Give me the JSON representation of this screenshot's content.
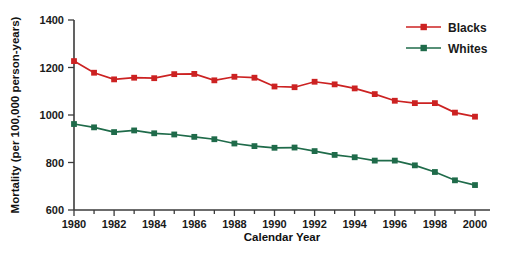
{
  "chart_data": {
    "type": "line",
    "title": "",
    "xlabel": "Calendar Year",
    "ylabel": "Mortality (per 100,000 person-years)",
    "xlim": [
      1980,
      2000.6
    ],
    "ylim": [
      600,
      1400
    ],
    "xticks": [
      1980,
      1982,
      1984,
      1986,
      1988,
      1990,
      1992,
      1994,
      1996,
      1998,
      2000
    ],
    "yticks": [
      600,
      800,
      1000,
      1200,
      1400
    ],
    "grid": false,
    "legend_position": "top-right",
    "x": [
      1980,
      1981,
      1982,
      1983,
      1984,
      1985,
      1986,
      1987,
      1988,
      1989,
      1990,
      1991,
      1992,
      1993,
      1994,
      1995,
      1996,
      1997,
      1998,
      1999,
      2000
    ],
    "series": [
      {
        "name": "Blacks",
        "color": "#cc2222",
        "marker": "square",
        "values": [
          1227,
          1178,
          1150,
          1157,
          1155,
          1172,
          1173,
          1146,
          1161,
          1157,
          1120,
          1117,
          1140,
          1129,
          1112,
          1088,
          1060,
          1050,
          1050,
          1010,
          993
        ]
      },
      {
        "name": "Whites",
        "color": "#1f6b4a",
        "marker": "square",
        "values": [
          962,
          948,
          928,
          935,
          923,
          918,
          908,
          898,
          880,
          869,
          862,
          863,
          848,
          832,
          822,
          808,
          808,
          788,
          760,
          725,
          705
        ]
      }
    ]
  },
  "legend": {
    "items": [
      {
        "label": "Blacks",
        "color": "#cc2222"
      },
      {
        "label": "Whites",
        "color": "#1f6b4a"
      }
    ]
  },
  "axes": {
    "x_title": "Calendar Year",
    "y_title": "Mortality (per 100,000 person-years)"
  }
}
